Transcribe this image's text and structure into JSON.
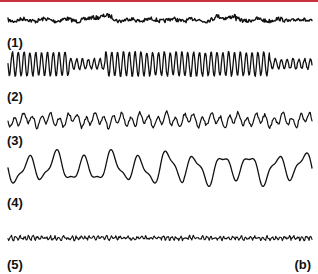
{
  "figure": {
    "panel_label": "(b)",
    "accent_color": "#c8323c",
    "traces": [
      {
        "label": "(1)",
        "description": "low-amplitude fast activity"
      },
      {
        "label": "(2)",
        "description": "high-amplitude rhythmic oscillation"
      },
      {
        "label": "(3)",
        "description": "medium-amplitude irregular waves"
      },
      {
        "label": "(4)",
        "description": "large slow waves"
      },
      {
        "label": "(5)",
        "description": "very low-amplitude noise"
      }
    ]
  }
}
